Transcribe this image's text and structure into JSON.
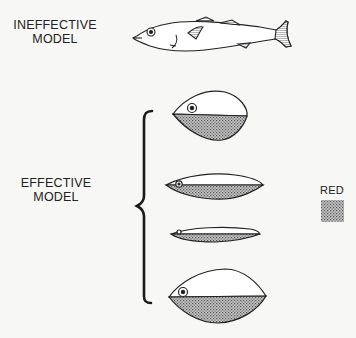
{
  "figure": {
    "ineffective_label_line1": "INEFFECTIVE",
    "ineffective_label_line2": "MODEL",
    "effective_label_line1": "EFFECTIVE",
    "effective_label_line2": "MODEL",
    "legend": {
      "label": "RED",
      "swatch": "stippled-gray"
    },
    "models": [
      {
        "name": "realistic-stickleback",
        "group": "ineffective",
        "red_belly": false
      },
      {
        "name": "round-model",
        "group": "effective",
        "red_belly": true
      },
      {
        "name": "elongated-model",
        "group": "effective",
        "red_belly": true
      },
      {
        "name": "thin-model",
        "group": "effective",
        "red_belly": true
      },
      {
        "name": "large-oval-model",
        "group": "effective",
        "red_belly": true
      }
    ]
  },
  "colors": {
    "background": "#f7f7f5",
    "ink": "#222222",
    "red_fill": "#9a9a9a"
  }
}
